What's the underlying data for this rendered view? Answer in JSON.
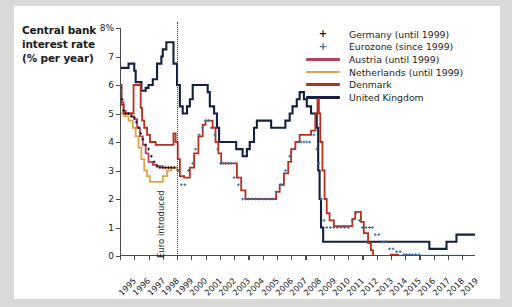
{
  "title": {
    "line1": "Central bank",
    "line2": "interest rate",
    "line3": "(% per year)"
  },
  "annotation": {
    "euro_label": "Euro introduced",
    "euro_year": 1999
  },
  "legend": [
    {
      "label": "Germany (until 1999)",
      "marker": "plus",
      "color": "#1b1b1b"
    },
    {
      "label": "Eurozone (since 1999)",
      "marker": "plus",
      "color": "#3a6ea8"
    },
    {
      "label": "Austria (until 1999)",
      "marker": "line",
      "color": "#b8425c"
    },
    {
      "label": "Netherlands (until 1999)",
      "marker": "line",
      "color": "#dda44a"
    },
    {
      "label": "Denmark",
      "marker": "line",
      "color": "#b5301f"
    },
    {
      "label": "United Kingdom",
      "marker": "line",
      "color": "#15203f"
    }
  ],
  "chart_data": {
    "type": "line",
    "title": "Central bank interest rate (% per year)",
    "xlabel": "",
    "ylabel": "% per year",
    "xlim": [
      1995,
      2019.9
    ],
    "ylim": [
      0,
      8
    ],
    "yticks": [
      0,
      1,
      2,
      3,
      4,
      5,
      6,
      7,
      8
    ],
    "ytick_labels": [
      "0",
      "1",
      "2",
      "3",
      "4",
      "5",
      "6",
      "7",
      "8%"
    ],
    "xticks": [
      1995,
      1996,
      1997,
      1998,
      1999,
      2000,
      2001,
      2002,
      2003,
      2004,
      2005,
      2006,
      2007,
      2008,
      2009,
      2010,
      2011,
      2012,
      2013,
      2014,
      2015,
      2016,
      2017,
      2018,
      2019
    ],
    "grid": false,
    "legend_position": "top-right",
    "annotations": [
      {
        "type": "vline",
        "x": 1999.0,
        "style": "dotted",
        "label": "Euro introduced"
      }
    ],
    "series": [
      {
        "name": "United Kingdom",
        "color": "#15203f",
        "style": "step",
        "points": [
          [
            1995.0,
            6.6
          ],
          [
            1995.15,
            6.6
          ],
          [
            1995.2,
            6.6
          ],
          [
            1995.6,
            6.75
          ],
          [
            1996.0,
            6.5
          ],
          [
            1996.1,
            6.1
          ],
          [
            1996.5,
            5.8
          ],
          [
            1996.8,
            5.9
          ],
          [
            1997.0,
            6.0
          ],
          [
            1997.3,
            6.2
          ],
          [
            1997.6,
            6.75
          ],
          [
            1997.9,
            7.0
          ],
          [
            1998.0,
            7.25
          ],
          [
            1998.25,
            7.5
          ],
          [
            1998.5,
            7.5
          ],
          [
            1998.75,
            6.75
          ],
          [
            1999.0,
            6.0
          ],
          [
            1999.2,
            5.25
          ],
          [
            1999.4,
            5.0
          ],
          [
            1999.7,
            5.25
          ],
          [
            1999.9,
            5.5
          ],
          [
            2000.1,
            6.0
          ],
          [
            2000.5,
            6.0
          ],
          [
            2001.0,
            6.0
          ],
          [
            2001.15,
            5.75
          ],
          [
            2001.3,
            5.25
          ],
          [
            2001.6,
            5.0
          ],
          [
            2001.8,
            4.5
          ],
          [
            2001.95,
            4.0
          ],
          [
            2002.2,
            4.0
          ],
          [
            2002.6,
            4.0
          ],
          [
            2003.0,
            4.0
          ],
          [
            2003.15,
            3.75
          ],
          [
            2003.6,
            3.5
          ],
          [
            2003.9,
            3.75
          ],
          [
            2004.1,
            4.0
          ],
          [
            2004.4,
            4.5
          ],
          [
            2004.6,
            4.75
          ],
          [
            2005.0,
            4.75
          ],
          [
            2005.6,
            4.5
          ],
          [
            2006.0,
            4.5
          ],
          [
            2006.6,
            4.75
          ],
          [
            2006.9,
            5.0
          ],
          [
            2007.1,
            5.25
          ],
          [
            2007.4,
            5.5
          ],
          [
            2007.6,
            5.75
          ],
          [
            2007.9,
            5.5
          ],
          [
            2008.1,
            5.25
          ],
          [
            2008.4,
            5.0
          ],
          [
            2008.8,
            4.5
          ],
          [
            2008.9,
            3.0
          ],
          [
            2009.0,
            2.0
          ],
          [
            2009.1,
            1.0
          ],
          [
            2009.25,
            0.5
          ],
          [
            2010.0,
            0.5
          ],
          [
            2012.0,
            0.5
          ],
          [
            2014.0,
            0.5
          ],
          [
            2016.5,
            0.5
          ],
          [
            2016.7,
            0.25
          ],
          [
            2017.7,
            0.25
          ],
          [
            2017.9,
            0.5
          ],
          [
            2018.6,
            0.75
          ],
          [
            2019.9,
            0.75
          ]
        ]
      },
      {
        "name": "Austria (until 1999)",
        "color": "#b8425c",
        "style": "step",
        "points": [
          [
            1995.0,
            6.0
          ],
          [
            1995.1,
            5.4
          ],
          [
            1995.25,
            5.1
          ],
          [
            1995.4,
            5.0
          ],
          [
            1995.6,
            5.0
          ],
          [
            1995.8,
            4.9
          ],
          [
            1996.0,
            4.8
          ],
          [
            1996.2,
            4.5
          ],
          [
            1996.4,
            4.2
          ],
          [
            1996.6,
            3.9
          ],
          [
            1996.8,
            3.6
          ],
          [
            1997.0,
            3.3
          ],
          [
            1997.3,
            3.2
          ],
          [
            1997.6,
            3.15
          ],
          [
            1998.0,
            3.1
          ],
          [
            1998.4,
            3.1
          ],
          [
            1998.8,
            3.1
          ],
          [
            1999.0,
            3.0
          ]
        ]
      },
      {
        "name": "Netherlands (until 1999)",
        "color": "#dda44a",
        "style": "step",
        "points": [
          [
            1995.0,
            5.0
          ],
          [
            1995.3,
            4.9
          ],
          [
            1995.6,
            4.75
          ],
          [
            1995.9,
            4.5
          ],
          [
            1996.1,
            4.2
          ],
          [
            1996.3,
            3.8
          ],
          [
            1996.5,
            3.4
          ],
          [
            1996.7,
            3.0
          ],
          [
            1996.9,
            2.8
          ],
          [
            1997.1,
            2.6
          ],
          [
            1997.4,
            2.6
          ],
          [
            1997.7,
            2.6
          ],
          [
            1998.0,
            2.8
          ],
          [
            1998.3,
            3.0
          ],
          [
            1998.6,
            3.1
          ],
          [
            1999.0,
            3.0
          ]
        ]
      },
      {
        "name": "Denmark",
        "color": "#b5301f",
        "style": "step",
        "points": [
          [
            1995.0,
            6.0
          ],
          [
            1995.1,
            5.3
          ],
          [
            1995.25,
            5.0
          ],
          [
            1995.5,
            5.0
          ],
          [
            1995.8,
            5.0
          ],
          [
            1995.95,
            6.0
          ],
          [
            1996.05,
            6.0
          ],
          [
            1996.3,
            6.0
          ],
          [
            1996.45,
            5.2
          ],
          [
            1996.55,
            4.75
          ],
          [
            1996.7,
            4.5
          ],
          [
            1996.9,
            4.25
          ],
          [
            1997.1,
            4.0
          ],
          [
            1997.5,
            3.9
          ],
          [
            1998.0,
            3.9
          ],
          [
            1998.3,
            3.9
          ],
          [
            1998.55,
            3.9
          ],
          [
            1998.75,
            4.3
          ],
          [
            1998.9,
            4.0
          ],
          [
            1999.05,
            3.4
          ],
          [
            1999.2,
            2.8
          ],
          [
            1999.5,
            2.75
          ],
          [
            1999.9,
            3.1
          ],
          [
            2000.2,
            3.6
          ],
          [
            2000.5,
            4.2
          ],
          [
            2000.8,
            4.6
          ],
          [
            2001.0,
            4.75
          ],
          [
            2001.3,
            4.75
          ],
          [
            2001.5,
            4.5
          ],
          [
            2001.7,
            4.0
          ],
          [
            2001.9,
            3.6
          ],
          [
            2002.1,
            3.25
          ],
          [
            2002.5,
            3.25
          ],
          [
            2003.0,
            3.25
          ],
          [
            2003.2,
            2.75
          ],
          [
            2003.5,
            2.3
          ],
          [
            2003.8,
            2.0
          ],
          [
            2004.0,
            2.0
          ],
          [
            2005.0,
            2.0
          ],
          [
            2005.8,
            2.0
          ],
          [
            2005.95,
            2.25
          ],
          [
            2006.2,
            2.5
          ],
          [
            2006.5,
            2.9
          ],
          [
            2006.8,
            3.3
          ],
          [
            2007.0,
            3.75
          ],
          [
            2007.3,
            4.0
          ],
          [
            2007.6,
            4.25
          ],
          [
            2008.0,
            4.25
          ],
          [
            2008.4,
            4.4
          ],
          [
            2008.7,
            5.0
          ],
          [
            2008.85,
            5.5
          ],
          [
            2008.95,
            5.0
          ],
          [
            2009.05,
            4.0
          ],
          [
            2009.2,
            3.0
          ],
          [
            2009.35,
            2.0
          ],
          [
            2009.5,
            1.5
          ],
          [
            2009.7,
            1.25
          ],
          [
            2010.0,
            1.05
          ],
          [
            2010.5,
            1.05
          ],
          [
            2011.0,
            1.05
          ],
          [
            2011.3,
            1.3
          ],
          [
            2011.5,
            1.55
          ],
          [
            2011.7,
            1.55
          ],
          [
            2011.9,
            1.2
          ],
          [
            2012.1,
            0.8
          ],
          [
            2012.4,
            0.45
          ],
          [
            2012.6,
            0.2
          ],
          [
            2012.75,
            -0.2
          ],
          [
            2013.0,
            -0.2
          ],
          [
            2013.3,
            -0.1
          ],
          [
            2014.0,
            0.05
          ],
          [
            2014.5,
            -0.05
          ],
          [
            2015.0,
            -0.75
          ],
          [
            2016.0,
            -0.65
          ],
          [
            2017.0,
            -0.65
          ],
          [
            2019.9,
            -0.65
          ]
        ]
      },
      {
        "name": "Germany (until 1999)",
        "color": "#1b1b1b",
        "style": "markers",
        "marker": "plus",
        "points": [
          [
            1995.05,
            5.9
          ],
          [
            1995.15,
            5.5
          ],
          [
            1995.25,
            5.1
          ],
          [
            1995.4,
            5.0
          ],
          [
            1995.6,
            5.0
          ],
          [
            1995.8,
            4.9
          ],
          [
            1996.0,
            4.85
          ],
          [
            1996.15,
            4.7
          ],
          [
            1996.3,
            4.5
          ],
          [
            1996.45,
            4.3
          ],
          [
            1996.6,
            4.1
          ],
          [
            1996.8,
            3.9
          ],
          [
            1997.0,
            3.75
          ],
          [
            1997.2,
            3.5
          ],
          [
            1997.4,
            3.3
          ],
          [
            1997.6,
            3.15
          ],
          [
            1997.8,
            3.1
          ],
          [
            1998.0,
            3.1
          ],
          [
            1998.2,
            3.1
          ],
          [
            1998.4,
            3.1
          ],
          [
            1998.6,
            3.1
          ],
          [
            1998.8,
            3.1
          ],
          [
            1998.95,
            3.0
          ]
        ]
      },
      {
        "name": "Eurozone (since 1999)",
        "color": "#3a6ea8",
        "style": "markers",
        "marker": "plus",
        "points": [
          [
            1999.1,
            3.0
          ],
          [
            1999.3,
            2.5
          ],
          [
            1999.55,
            2.5
          ],
          [
            1999.8,
            3.0
          ],
          [
            2000.1,
            3.25
          ],
          [
            2000.3,
            3.75
          ],
          [
            2000.55,
            4.25
          ],
          [
            2000.8,
            4.5
          ],
          [
            2001.0,
            4.75
          ],
          [
            2001.2,
            4.75
          ],
          [
            2001.4,
            4.5
          ],
          [
            2001.65,
            4.25
          ],
          [
            2001.85,
            3.75
          ],
          [
            2002.05,
            3.25
          ],
          [
            2002.4,
            3.25
          ],
          [
            2002.8,
            3.25
          ],
          [
            2003.0,
            2.75
          ],
          [
            2003.3,
            2.5
          ],
          [
            2003.6,
            2.0
          ],
          [
            2004.0,
            2.0
          ],
          [
            2004.5,
            2.0
          ],
          [
            2005.0,
            2.0
          ],
          [
            2005.5,
            2.0
          ],
          [
            2005.95,
            2.25
          ],
          [
            2006.25,
            2.5
          ],
          [
            2006.6,
            3.0
          ],
          [
            2006.9,
            3.5
          ],
          [
            2007.2,
            3.75
          ],
          [
            2007.5,
            4.0
          ],
          [
            2007.9,
            4.0
          ],
          [
            2008.3,
            4.0
          ],
          [
            2008.6,
            4.25
          ],
          [
            2008.8,
            3.75
          ],
          [
            2008.95,
            3.25
          ],
          [
            2009.1,
            2.0
          ],
          [
            2009.3,
            1.25
          ],
          [
            2009.5,
            1.0
          ],
          [
            2010.0,
            1.0
          ],
          [
            2010.5,
            1.0
          ],
          [
            2011.0,
            1.0
          ],
          [
            2011.3,
            1.25
          ],
          [
            2011.55,
            1.5
          ],
          [
            2011.8,
            1.25
          ],
          [
            2012.0,
            1.0
          ],
          [
            2012.5,
            1.0
          ],
          [
            2012.9,
            0.75
          ],
          [
            2013.4,
            0.5
          ],
          [
            2013.9,
            0.25
          ],
          [
            2014.4,
            0.15
          ],
          [
            2014.9,
            0.05
          ],
          [
            2015.5,
            0.05
          ],
          [
            2016.2,
            0.0
          ],
          [
            2017.0,
            0.0
          ],
          [
            2018.0,
            0.0
          ],
          [
            2019.5,
            0.0
          ]
        ]
      }
    ]
  }
}
